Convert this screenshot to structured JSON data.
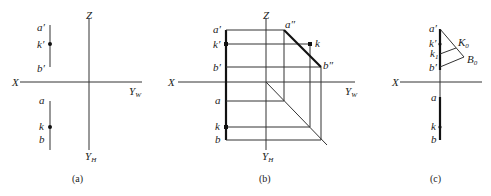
{
  "figure": {
    "panel_a": {
      "caption": "(a)",
      "axis_labels": {
        "x": "X",
        "z": "Z",
        "yw": "Y",
        "yw_sub": "W",
        "yh": "Y",
        "yh_sub": "H"
      },
      "point_labels": {
        "a_prime": "a′",
        "k_prime": "k′",
        "b_prime": "b′",
        "a": "a",
        "k": "k",
        "b": "b"
      }
    },
    "panel_b": {
      "caption": "(b)",
      "axis_labels": {
        "x": "X",
        "z": "Z",
        "yw": "Y",
        "yw_sub": "W",
        "yh": "Y",
        "yh_sub": "H"
      },
      "point_labels": {
        "a_prime": "a′",
        "k_prime": "k′",
        "b_prime": "b′",
        "a_dprime": "a″",
        "k_dprime": "k",
        "b_dprime": "b″",
        "a": "a",
        "k": "k",
        "b": "b"
      }
    },
    "panel_c": {
      "caption": "(c)",
      "axis_labels": {
        "x": "X"
      },
      "point_labels": {
        "a_prime": "a′",
        "k_prime": "k′",
        "k1": "k",
        "k1_sub": "1",
        "b_prime": "b′",
        "K0": "K",
        "K0_sub": "0",
        "B0": "B",
        "B0_sub": "0",
        "a": "a",
        "k": "k",
        "b": "b"
      }
    }
  }
}
